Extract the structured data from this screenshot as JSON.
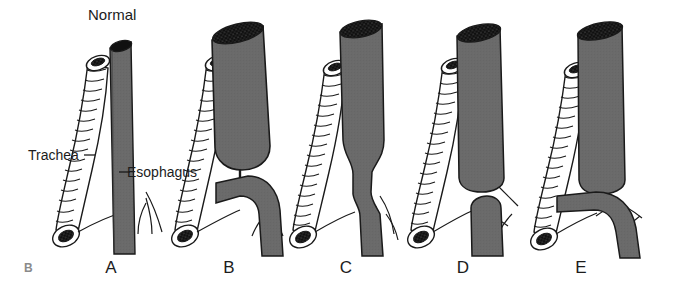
{
  "figure": {
    "title": "Normal",
    "part_label": "B",
    "background_color": "#ffffff",
    "esophagus_color": "#6a6a6a",
    "esophagus_dark_color": "#4f4f4f",
    "lumen_color": "#101010",
    "trachea_color": "#ffffff",
    "outline_color": "#1a1a1a",
    "annotations": [
      {
        "name": "trachea",
        "text": "Trachea"
      },
      {
        "name": "esophagus",
        "text": "Esophagus"
      }
    ],
    "panels": [
      {
        "letter": "A",
        "name": "normal-anatomy",
        "description": "Normal trachea and continuous esophagus"
      },
      {
        "letter": "B",
        "name": "atresia-with-proximal-fistula",
        "description": "Blind upper esophageal pouch with fistula to trachea"
      },
      {
        "letter": "C",
        "name": "esophageal-stenosis",
        "description": "Continuous esophagus with narrowed mid segment"
      },
      {
        "letter": "D",
        "name": "pure-atresia",
        "description": "Esophageal atresia without tracheoesophageal fistula"
      },
      {
        "letter": "E",
        "name": "atresia-with-distal-fistula",
        "description": "Esophageal atresia with distal tracheoesophageal fistula"
      }
    ]
  }
}
